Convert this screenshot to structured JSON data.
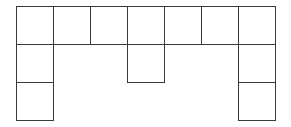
{
  "diagram": {
    "type": "polyomino-grid",
    "origin": {
      "x": 16,
      "y": 6
    },
    "cell_size": 37,
    "row_height": 38,
    "line_color": "#3a3a3a",
    "cells": [
      {
        "row": 0,
        "col": 0
      },
      {
        "row": 0,
        "col": 1
      },
      {
        "row": 0,
        "col": 2
      },
      {
        "row": 0,
        "col": 3
      },
      {
        "row": 0,
        "col": 4
      },
      {
        "row": 0,
        "col": 5
      },
      {
        "row": 0,
        "col": 6
      },
      {
        "row": 1,
        "col": 0
      },
      {
        "row": 1,
        "col": 3
      },
      {
        "row": 1,
        "col": 6
      },
      {
        "row": 2,
        "col": 0
      },
      {
        "row": 2,
        "col": 6
      }
    ]
  }
}
